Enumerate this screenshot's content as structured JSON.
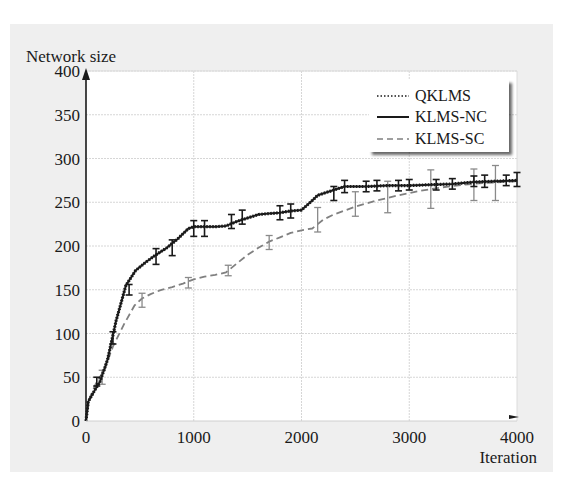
{
  "chart_data": {
    "type": "line",
    "title": "",
    "xlabel": "Iteration",
    "ylabel": "Network size",
    "xlim": [
      0,
      4000
    ],
    "ylim": [
      0,
      400
    ],
    "x_ticks": [
      "0",
      "1000",
      "2000",
      "3000",
      "4000"
    ],
    "y_ticks": [
      "0",
      "50",
      "100",
      "150",
      "200",
      "250",
      "300",
      "350",
      "400"
    ],
    "grid": true,
    "legend_position": "upper right",
    "legend": [
      "QKLMS",
      "KLMS-NC",
      "KLMS-SC"
    ],
    "series": [
      {
        "name": "QKLMS",
        "style": "dotted",
        "color": "#1a1a1a",
        "x": [
          0,
          20,
          80,
          130,
          200,
          280,
          370,
          460,
          560,
          650,
          750,
          850,
          950,
          1000,
          1100,
          1200,
          1300,
          1400,
          1500,
          1600,
          1700,
          1800,
          1900,
          2000,
          2100,
          2150,
          2200,
          2300,
          2400,
          2600,
          2800,
          3000,
          3200,
          3400,
          3600,
          3800,
          4000
        ],
        "y": [
          0,
          22,
          35,
          45,
          70,
          115,
          155,
          172,
          182,
          190,
          198,
          208,
          220,
          222,
          222,
          222,
          223,
          228,
          232,
          236,
          237,
          238,
          240,
          241,
          252,
          258,
          260,
          264,
          268,
          268,
          269,
          269,
          270,
          271,
          273,
          274,
          275
        ]
      },
      {
        "name": "KLMS-NC",
        "style": "solid",
        "color": "#1a1a1a",
        "x": [
          0,
          20,
          80,
          130,
          200,
          280,
          370,
          460,
          560,
          650,
          750,
          850,
          950,
          1000,
          1100,
          1200,
          1300,
          1400,
          1500,
          1600,
          1700,
          1800,
          1900,
          2000,
          2100,
          2150,
          2200,
          2300,
          2400,
          2600,
          2800,
          3000,
          3200,
          3400,
          3600,
          3800,
          4000
        ],
        "y": [
          0,
          22,
          35,
          45,
          70,
          115,
          155,
          172,
          182,
          190,
          198,
          208,
          220,
          222,
          222,
          222,
          223,
          228,
          232,
          236,
          237,
          238,
          240,
          241,
          252,
          258,
          260,
          264,
          268,
          268,
          269,
          269,
          270,
          271,
          273,
          274,
          275
        ],
        "error_bars": {
          "x": [
            100,
            250,
            400,
            650,
            800,
            1000,
            1100,
            1350,
            1450,
            1800,
            1900,
            2300,
            2400,
            2600,
            2700,
            2900,
            3000,
            3250,
            3400,
            3600,
            3700,
            3900,
            4000
          ],
          "y": [
            45,
            95,
            150,
            188,
            198,
            220,
            220,
            228,
            233,
            238,
            240,
            260,
            268,
            268,
            269,
            269,
            270,
            270,
            271,
            274,
            274,
            275,
            276
          ],
          "err": [
            5,
            7,
            6,
            9,
            9,
            9,
            9,
            8,
            8,
            8,
            8,
            8,
            7,
            6,
            6,
            6,
            6,
            6,
            6,
            6,
            7,
            6,
            8
          ]
        }
      },
      {
        "name": "KLMS-SC",
        "style": "dashed",
        "color": "#808080",
        "x": [
          0,
          30,
          100,
          170,
          250,
          350,
          450,
          520,
          600,
          700,
          800,
          900,
          1000,
          1100,
          1200,
          1300,
          1400,
          1500,
          1600,
          1700,
          1800,
          1900,
          2000,
          2100,
          2200,
          2300,
          2500,
          2700,
          2900,
          3100,
          3300,
          3500,
          3700,
          4000
        ],
        "y": [
          0,
          25,
          45,
          58,
          85,
          110,
          132,
          140,
          145,
          150,
          153,
          157,
          162,
          165,
          167,
          170,
          180,
          190,
          198,
          205,
          210,
          215,
          218,
          220,
          230,
          236,
          245,
          252,
          258,
          263,
          267,
          270,
          272,
          274
        ],
        "error_bars": {
          "x": [
            150,
            520,
            950,
            1320,
            1700,
            2150,
            2500,
            2800,
            3200,
            3600,
            3800
          ],
          "y": [
            50,
            138,
            158,
            172,
            204,
            230,
            248,
            256,
            265,
            270,
            272
          ],
          "err": [
            8,
            8,
            6,
            6,
            8,
            14,
            14,
            18,
            22,
            18,
            20
          ]
        }
      }
    ]
  }
}
